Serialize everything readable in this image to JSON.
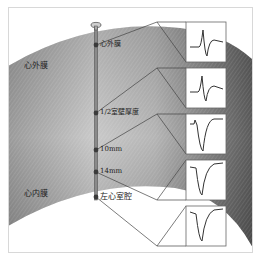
{
  "diagram": {
    "regions": {
      "epicardium": "心外膜",
      "endocardium": "心内膜"
    },
    "electrode_points": [
      {
        "label": "心外膜",
        "y": 45
      },
      {
        "label": "1/2室壁厚度",
        "y": 113
      },
      {
        "label": "10mm",
        "y": 150
      },
      {
        "label": "14mm",
        "y": 172
      },
      {
        "label": "左心室腔",
        "y": 197
      }
    ],
    "waveforms": [
      {
        "position": "心外膜",
        "shape": "biphasic-positive-first"
      },
      {
        "position": "1/2室壁厚度",
        "shape": "biphasic-positive-first"
      },
      {
        "position": "10mm",
        "shape": "small-r-deep-negative"
      },
      {
        "position": "14mm",
        "shape": "deep-negative"
      },
      {
        "position": "左心室腔",
        "shape": "deep-negative"
      }
    ],
    "colors": {
      "frame": "#d8d8d8",
      "band_dark": "#6e6e6e",
      "band_light": "#d6d6d6",
      "line": "#444444",
      "electrode": "#555555"
    }
  }
}
